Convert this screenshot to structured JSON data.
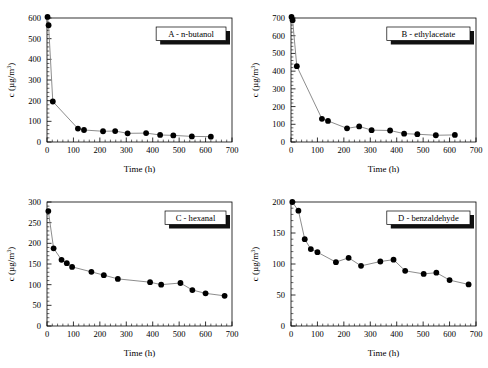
{
  "figure": {
    "background": "#ffffff",
    "marker_color": "#000000",
    "line_color": "#808080",
    "axis_color": "#000000"
  },
  "axis_titles": {
    "x": "Time (h)",
    "y_prefix": "c (",
    "y_unit": "µg/m",
    "y_exp": "3",
    "y_suffix": ")"
  },
  "chart_data": [
    {
      "type": "line",
      "panel": "A",
      "title": "A - n-butanol",
      "xlabel": "Time (h)",
      "ylabel": "c (µg/m3)",
      "xlim": [
        0,
        700
      ],
      "ylim": [
        0,
        600
      ],
      "xticks": [
        0,
        100,
        200,
        300,
        400,
        500,
        600,
        700
      ],
      "yticks": [
        0,
        100,
        200,
        300,
        400,
        500,
        600
      ],
      "grid": false,
      "legend_position": "top-right",
      "x": [
        2,
        6,
        22,
        117,
        140,
        212,
        258,
        305,
        375,
        428,
        478,
        548,
        620
      ],
      "y": [
        605,
        565,
        196,
        65,
        58,
        52,
        53,
        42,
        43,
        34,
        32,
        27,
        26
      ]
    },
    {
      "type": "line",
      "panel": "B",
      "title": "B - ethylacetate",
      "xlabel": "Time (h)",
      "ylabel": "c (µg/m3)",
      "xlim": [
        0,
        700
      ],
      "ylim": [
        0,
        700
      ],
      "xticks": [
        0,
        100,
        200,
        300,
        400,
        500,
        600,
        700
      ],
      "yticks": [
        0,
        100,
        200,
        300,
        400,
        500,
        600,
        700
      ],
      "grid": false,
      "legend_position": "top-right",
      "x": [
        2,
        6,
        22,
        117,
        140,
        212,
        258,
        305,
        375,
        428,
        478,
        548,
        620
      ],
      "y": [
        706,
        688,
        428,
        131,
        119,
        77,
        88,
        67,
        65,
        47,
        44,
        38,
        40
      ]
    },
    {
      "type": "line",
      "panel": "C",
      "title": "C - hexanal",
      "xlabel": "Time (h)",
      "ylabel": "c (µg/m3)",
      "xlim": [
        0,
        700
      ],
      "ylim": [
        0,
        300
      ],
      "xticks": [
        0,
        100,
        200,
        300,
        400,
        500,
        600,
        700
      ],
      "yticks": [
        0,
        50,
        100,
        150,
        200,
        250,
        300
      ],
      "grid": false,
      "legend_position": "top-right",
      "x": [
        5,
        25,
        55,
        75,
        95,
        168,
        215,
        268,
        390,
        432,
        505,
        550,
        600,
        672
      ],
      "y": [
        278,
        188,
        160,
        152,
        143,
        131,
        123,
        114,
        106,
        100,
        104,
        87,
        79,
        73
      ]
    },
    {
      "type": "line",
      "panel": "D",
      "title": "D - benzaldehyde",
      "xlabel": "Time (h)",
      "ylabel": "c (µg/m3)",
      "xlim": [
        0,
        700
      ],
      "ylim": [
        0,
        200
      ],
      "xticks": [
        0,
        100,
        200,
        300,
        400,
        500,
        600,
        700
      ],
      "yticks": [
        0,
        50,
        100,
        150,
        200
      ],
      "grid": false,
      "legend_position": "top-right",
      "x": [
        5,
        28,
        52,
        75,
        100,
        170,
        218,
        265,
        338,
        388,
        432,
        502,
        550,
        600,
        672
      ],
      "y": [
        200,
        186,
        140,
        124,
        119,
        103,
        110,
        97,
        104,
        107,
        89,
        84,
        86,
        74,
        67
      ]
    }
  ]
}
